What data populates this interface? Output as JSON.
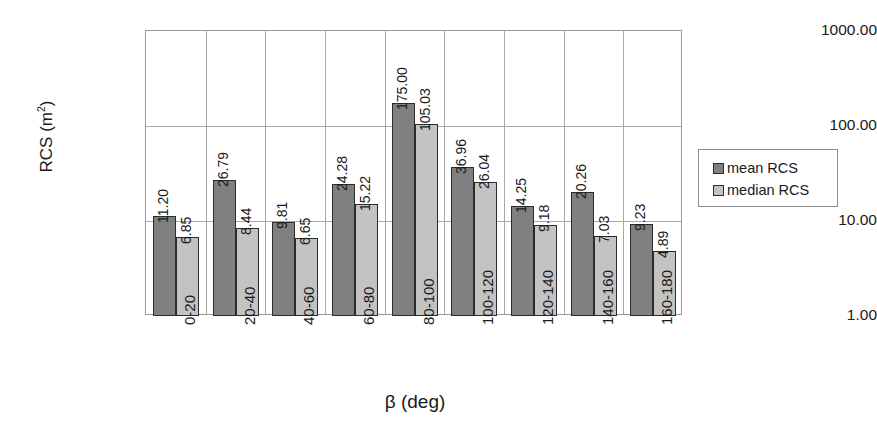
{
  "chart_data": {
    "type": "bar",
    "title": "",
    "xlabel": "β (deg)",
    "ylabel": "RCS (m²)",
    "ylabel_base": "RCS (m",
    "ylabel_sup": "2",
    "ylabel_tail": ")",
    "yscale": "log",
    "ylim": [
      1.0,
      1000.0
    ],
    "grid": true,
    "legend_position": "right",
    "ytick_labels": [
      "1000.00",
      "100.00",
      "10.00",
      "1.00"
    ],
    "ytick_values": [
      1000,
      100,
      10,
      1
    ],
    "categories": [
      "0-20",
      "20-40",
      "40-60",
      "60-80",
      "80-100",
      "100-120",
      "120-140",
      "140-160",
      "160-180"
    ],
    "series": [
      {
        "name": "mean RCS",
        "color": "#808080",
        "values": [
          11.2,
          26.79,
          9.81,
          24.28,
          175.0,
          36.96,
          14.25,
          20.26,
          9.23
        ],
        "labels": [
          "11.20",
          "26.79",
          "9.81",
          "24.28",
          "175.00",
          "36.96",
          "14.25",
          "20.26",
          "9.23"
        ]
      },
      {
        "name": "median RCS",
        "color": "#c3c3c3",
        "values": [
          6.85,
          8.44,
          6.65,
          15.22,
          105.03,
          26.04,
          9.18,
          7.03,
          4.89
        ],
        "labels": [
          "6.85",
          "8.44",
          "6.65",
          "15.22",
          "105.03",
          "26.04",
          "9.18",
          "7.03",
          "4.89"
        ]
      }
    ]
  },
  "legend": {
    "entries": [
      {
        "label": "mean RCS",
        "color": "#808080"
      },
      {
        "label": "median RCS",
        "color": "#c3c3c3"
      }
    ]
  }
}
